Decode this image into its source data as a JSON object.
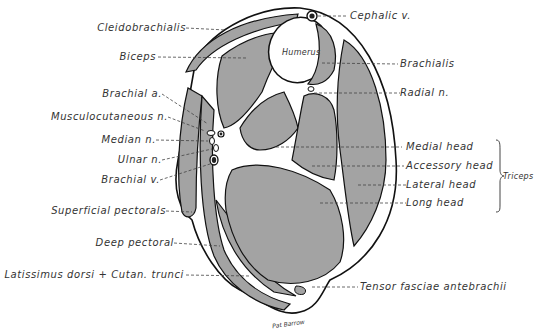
{
  "figure": {
    "colors": {
      "muscle_fill": "#a3a3a3",
      "fascia": "#ffffff",
      "outline": "#111111",
      "text": "#333333",
      "leader": "#444444"
    },
    "labels_left": [
      {
        "id": "cleidobrachialis",
        "text": "Cleidobrachialis"
      },
      {
        "id": "biceps",
        "text": "Biceps"
      },
      {
        "id": "brachial-a",
        "text": "Brachial   a."
      },
      {
        "id": "musculocutaneous-n",
        "text": "Musculocutaneous   n."
      },
      {
        "id": "median-n",
        "text": "Median   n."
      },
      {
        "id": "ulnar-n",
        "text": "Ulnar   n."
      },
      {
        "id": "brachial-v",
        "text": "Brachial   v."
      },
      {
        "id": "superficial-pectorals",
        "text": "Superficial  pectorals"
      },
      {
        "id": "deep-pectoral",
        "text": "Deep  pectoral"
      },
      {
        "id": "latissimus",
        "text": "Latissimus  dorsi  + Cutan.  trunci"
      }
    ],
    "labels_right": [
      {
        "id": "cephalic-v",
        "text": "Cephalic  v."
      },
      {
        "id": "brachialis",
        "text": "Brachialis"
      },
      {
        "id": "radial-n",
        "text": "Radial   n."
      },
      {
        "id": "medial-head",
        "text": "Medial   head"
      },
      {
        "id": "accessory-head",
        "text": "Accessory   head"
      },
      {
        "id": "lateral-head",
        "text": "Lateral   head"
      },
      {
        "id": "long-head",
        "text": "Long   head"
      },
      {
        "id": "tensor",
        "text": "Tensor  fasciae  antebrachii"
      }
    ],
    "group_label": "Triceps",
    "inner_label": "Humerus",
    "signature": "Pat Barrow"
  }
}
